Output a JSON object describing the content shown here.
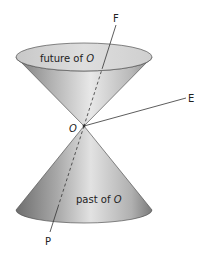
{
  "diagram": {
    "type": "light-cone",
    "labels": {
      "future": "future of",
      "past": "past of",
      "origin": "O",
      "F": "F",
      "E": "E",
      "P": "P"
    },
    "colors": {
      "cone_light": "#e4e4e4",
      "cone_dark": "#8a8a8a",
      "ellipse_fill": "#d6d6d6",
      "stroke": "#555555",
      "line": "#333333"
    }
  }
}
